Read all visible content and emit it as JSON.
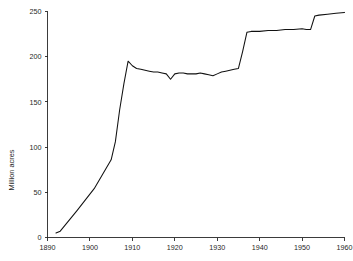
{
  "chart_data": {
    "type": "line",
    "title": "",
    "xlabel": "",
    "ylabel": "Million acres",
    "xlim": [
      1890,
      1960
    ],
    "ylim": [
      0,
      250
    ],
    "grid": false,
    "legend": false,
    "xticks": [
      1890,
      1900,
      1910,
      1920,
      1930,
      1940,
      1950,
      1960
    ],
    "yticks": [
      0,
      50,
      100,
      150,
      200,
      250
    ],
    "xtick_labels": [
      "1890",
      "1900",
      "1910",
      "1920",
      "1930",
      "1940",
      "1950",
      "1960"
    ],
    "ytick_labels": [
      "0",
      "50",
      "100",
      "150",
      "200",
      "250"
    ],
    "series": [
      {
        "name": "Million acres",
        "color": "#111111",
        "x": [
          1892,
          1893,
          1897,
          1901,
          1905,
          1906,
          1907,
          1908,
          1909,
          1910,
          1911,
          1912,
          1913,
          1914,
          1915,
          1916,
          1917,
          1918,
          1919,
          1920,
          1921,
          1922,
          1923,
          1924,
          1925,
          1926,
          1927,
          1928,
          1929,
          1930,
          1931,
          1932,
          1933,
          1934,
          1935,
          1936,
          1937,
          1938,
          1940,
          1942,
          1944,
          1946,
          1948,
          1950,
          1951,
          1952,
          1953,
          1954,
          1956,
          1958,
          1960
        ],
        "y": [
          5,
          7,
          30,
          54,
          86,
          106,
          141,
          170,
          195,
          190,
          187,
          186,
          185,
          184,
          183,
          183,
          182,
          181,
          175,
          181,
          182,
          182,
          181,
          181,
          181,
          182,
          181,
          180,
          179,
          181,
          183,
          184,
          185,
          186,
          187,
          206,
          227,
          228,
          228,
          229,
          229,
          230,
          230,
          231,
          230,
          230,
          245,
          246,
          247,
          248,
          249
        ]
      }
    ]
  },
  "axes": {
    "y_title": "Million acres"
  }
}
